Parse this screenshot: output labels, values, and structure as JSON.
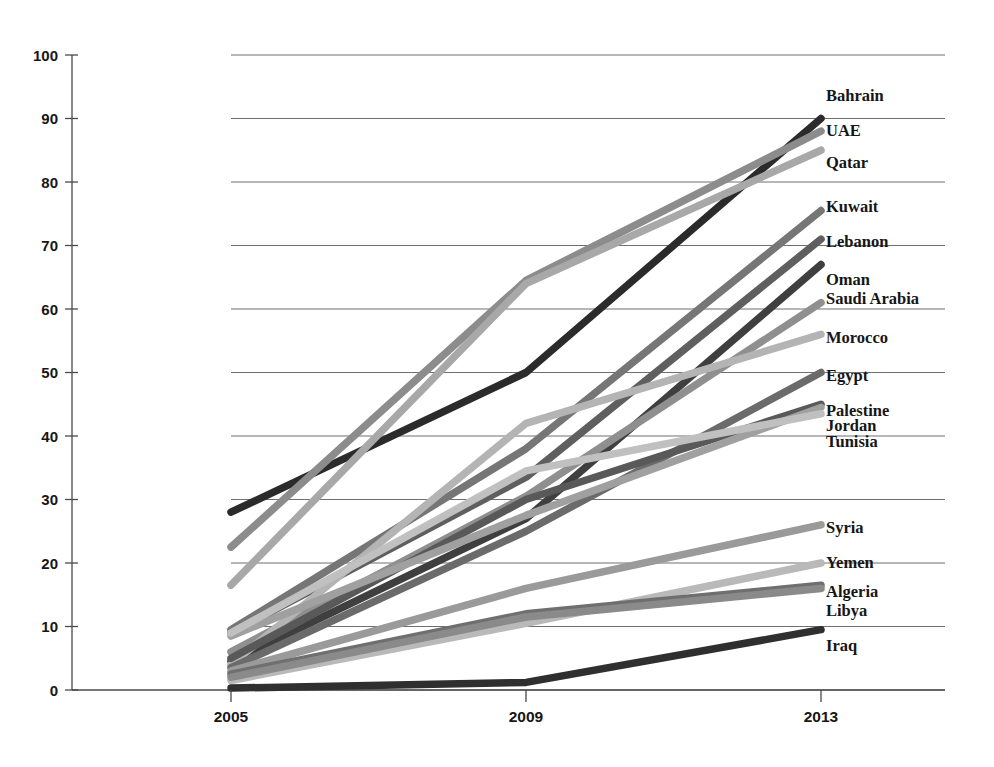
{
  "chart_data": {
    "type": "line",
    "title": "",
    "subtitle": "",
    "xlabel": "",
    "ylabel": "",
    "x": [
      "2005",
      "2009",
      "2013"
    ],
    "categories": [
      "2005",
      "2009",
      "2013"
    ],
    "ylim": [
      0,
      100
    ],
    "ytick_labels": [
      "0",
      "10",
      "20",
      "30",
      "40",
      "50",
      "60",
      "70",
      "80",
      "90",
      "100"
    ],
    "ytick_values": [
      0,
      10,
      20,
      30,
      40,
      50,
      60,
      70,
      80,
      90,
      100
    ],
    "grid": true,
    "grid_axis": "y",
    "legend_position": "right-inline-labels",
    "series": [
      {
        "name": "Bahrain",
        "values": [
          28.0,
          50.0,
          90.0
        ],
        "color": "#2b2b2b"
      },
      {
        "name": "UAE",
        "values": [
          22.5,
          64.5,
          88.0
        ],
        "color": "#8c8c8c"
      },
      {
        "name": "Qatar",
        "values": [
          16.5,
          64.0,
          85.0
        ],
        "color": "#a8a8a8"
      },
      {
        "name": "Kuwait",
        "values": [
          9.5,
          38.0,
          75.5
        ],
        "color": "#767676"
      },
      {
        "name": "Lebanon",
        "values": [
          9.0,
          33.5,
          71.0
        ],
        "color": "#5f5f5f"
      },
      {
        "name": "Oman",
        "values": [
          4.5,
          27.0,
          67.0
        ],
        "color": "#3f3f3f"
      },
      {
        "name": "Saudi Arabia",
        "values": [
          6.0,
          30.5,
          61.0
        ],
        "color": "#8f8f8f"
      },
      {
        "name": "Morocco",
        "values": [
          4.0,
          42.0,
          56.0
        ],
        "color": "#b4b4b4"
      },
      {
        "name": "Egypt",
        "values": [
          3.5,
          25.0,
          50.0
        ],
        "color": "#6b6b6b"
      },
      {
        "name": "Palestine",
        "values": [
          5.0,
          30.0,
          45.0
        ],
        "color": "#595959"
      },
      {
        "name": "Jordan",
        "values": [
          8.5,
          27.5,
          44.5
        ],
        "color": "#a0a0a0"
      },
      {
        "name": "Tunisia",
        "values": [
          9.0,
          34.5,
          43.5
        ],
        "color": "#c0c0c0"
      },
      {
        "name": "Syria",
        "values": [
          3.0,
          16.0,
          26.0
        ],
        "color": "#9a9a9a"
      },
      {
        "name": "Yemen",
        "values": [
          1.5,
          10.5,
          20.0
        ],
        "color": "#b9b9b9"
      },
      {
        "name": "Algeria",
        "values": [
          2.5,
          12.0,
          16.5
        ],
        "color": "#6f6f6f"
      },
      {
        "name": "Libya",
        "values": [
          2.0,
          11.5,
          16.0
        ],
        "color": "#8a8a8a"
      },
      {
        "name": "Iraq",
        "values": [
          0.3,
          1.2,
          9.5
        ],
        "color": "#2f2f2f"
      }
    ],
    "label_rows": [
      {
        "text": "Bahrain",
        "value": 93.5
      },
      {
        "text": "UAE",
        "value": 88.0
      },
      {
        "text": "Qatar",
        "value": 83.0
      },
      {
        "text": "Kuwait",
        "value": 76.0
      },
      {
        "text": "Lebanon",
        "value": 70.5
      },
      {
        "text": "Oman",
        "value": 64.5
      },
      {
        "text": "Saudi Arabia",
        "value": 61.5
      },
      {
        "text": "Morocco",
        "value": 55.5
      },
      {
        "text": "Egypt",
        "value": 49.5
      },
      {
        "text": "Palestine",
        "value": 44.0
      },
      {
        "text": "Jordan",
        "value": 41.5
      },
      {
        "text": "Tunisia",
        "value": 39.0
      },
      {
        "text": "Syria",
        "value": 25.5
      },
      {
        "text": "Yemen",
        "value": 20.0
      },
      {
        "text": "Algeria",
        "value": 15.5
      },
      {
        "text": "Libya",
        "value": 12.5
      },
      {
        "text": "Iraq",
        "value": 7.0
      }
    ]
  },
  "caption": {
    "text": ""
  }
}
